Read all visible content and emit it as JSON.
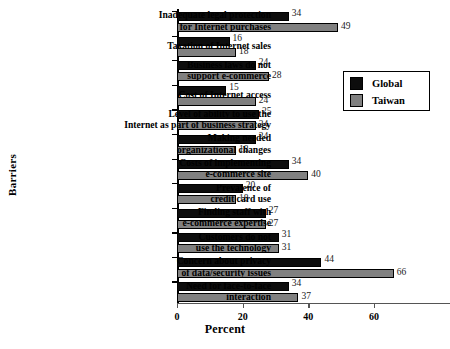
{
  "chart_data": {
    "type": "bar",
    "orientation": "horizontal",
    "title": "",
    "xlabel": "Percent",
    "ylabel": "Barriers",
    "xlim": [
      0,
      70
    ],
    "xticks": [
      0,
      20,
      40,
      60
    ],
    "grid": false,
    "legend_position": "upper-right",
    "categories": [
      "Inadequate legal protection\nfor Internet purchases",
      "Taxation of Internet sales",
      "Business laws do not\nsupport e-commerce",
      "Cost of Internet access",
      "Level of ability to use the\nInternet as part of business strategy",
      "Making needed\norganizational changes",
      "Costs of implementing\ne-commerce site",
      "Prevalence of\ncredit card use",
      "Finding staff with\ne-commerce expertise",
      "Customers do not\nuse the technology",
      "Concern about privacy\nof data/security issues",
      "Need for face-to-face\ninteraction"
    ],
    "series": [
      {
        "name": "Global",
        "color": "#0d0d0d",
        "values": [
          34,
          16,
          24,
          15,
          25,
          24,
          34,
          20,
          27,
          31,
          44,
          34
        ]
      },
      {
        "name": "Taiwan",
        "color": "#808080",
        "values": [
          49,
          18,
          28,
          24,
          24,
          18,
          40,
          18,
          27,
          31,
          66,
          37
        ]
      }
    ]
  },
  "legend": {
    "entries": [
      {
        "label": "Global",
        "color": "#0d0d0d"
      },
      {
        "label": "Taiwan",
        "color": "#808080"
      }
    ]
  }
}
